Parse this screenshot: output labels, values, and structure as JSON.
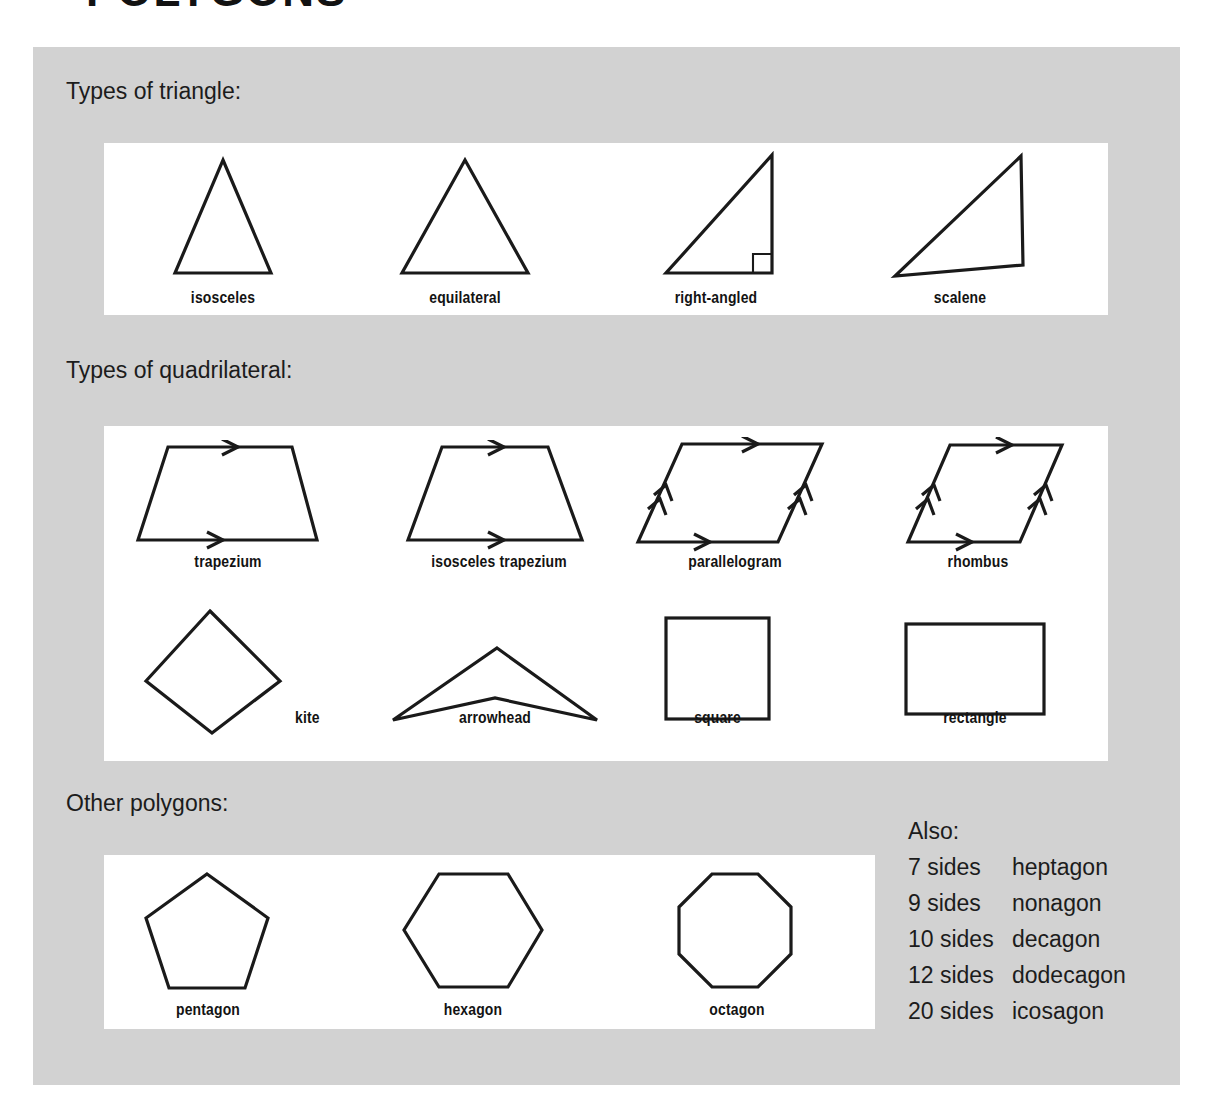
{
  "page": {
    "title": "POLYGONS"
  },
  "sections": [
    {
      "id": "triangles",
      "heading": "Types of triangle:",
      "shapes": [
        {
          "name": "isosceles",
          "icon": "isosceles-triangle-shape"
        },
        {
          "name": "equilateral",
          "icon": "equilateral-triangle-shape"
        },
        {
          "name": "right-angled",
          "icon": "right-angled-triangle-shape"
        },
        {
          "name": "scalene",
          "icon": "scalene-triangle-shape"
        }
      ]
    },
    {
      "id": "quadrilaterals",
      "heading": "Types of quadrilateral:",
      "shapes": [
        {
          "name": "trapezium",
          "icon": "trapezium-shape"
        },
        {
          "name": "isosceles trapezium",
          "icon": "isosceles-trapezium-shape"
        },
        {
          "name": "parallelogram",
          "icon": "parallelogram-shape"
        },
        {
          "name": "rhombus",
          "icon": "rhombus-shape"
        },
        {
          "name": "kite",
          "icon": "kite-shape"
        },
        {
          "name": "arrowhead",
          "icon": "arrowhead-shape"
        },
        {
          "name": "square",
          "icon": "square-shape"
        },
        {
          "name": "rectangle",
          "icon": "rectangle-shape"
        }
      ]
    },
    {
      "id": "other-polygons",
      "heading": "Other polygons:",
      "shapes": [
        {
          "name": "pentagon",
          "icon": "pentagon-shape"
        },
        {
          "name": "hexagon",
          "icon": "hexagon-shape"
        },
        {
          "name": "octagon",
          "icon": "octagon-shape"
        }
      ]
    }
  ],
  "also": {
    "title": "Also:",
    "rows": [
      {
        "sides": "7 sides",
        "name": "heptagon"
      },
      {
        "sides": "9 sides",
        "name": "nonagon"
      },
      {
        "sides": "10 sides",
        "name": "decagon"
      },
      {
        "sides": "12 sides",
        "name": "dodecagon"
      },
      {
        "sides": "20 sides",
        "name": "icosagon"
      }
    ]
  },
  "colors": {
    "card_background": "#d2d2d2",
    "panel_background": "#ffffff",
    "stroke": "#1a1a1a",
    "text": "#1c1c1c"
  }
}
